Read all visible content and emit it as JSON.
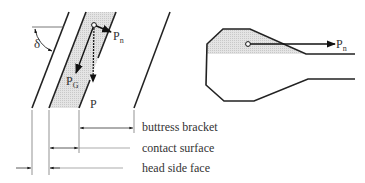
{
  "left_figure": {
    "angle_label": "δ",
    "force_normal": {
      "main": "P",
      "sub": "n"
    },
    "force_gravity": {
      "main": "P",
      "sub": "G"
    },
    "force_total": "P"
  },
  "right_figure": {
    "force_normal": {
      "main": "P",
      "sub": "n"
    }
  },
  "dimension_labels": {
    "buttress_bracket": "buttress bracket",
    "contact_surface": "contact surface",
    "head_side_face": "head side face"
  },
  "colors": {
    "line": "#222222",
    "shade": "#d8d8d8",
    "thin_line": "#555555"
  }
}
